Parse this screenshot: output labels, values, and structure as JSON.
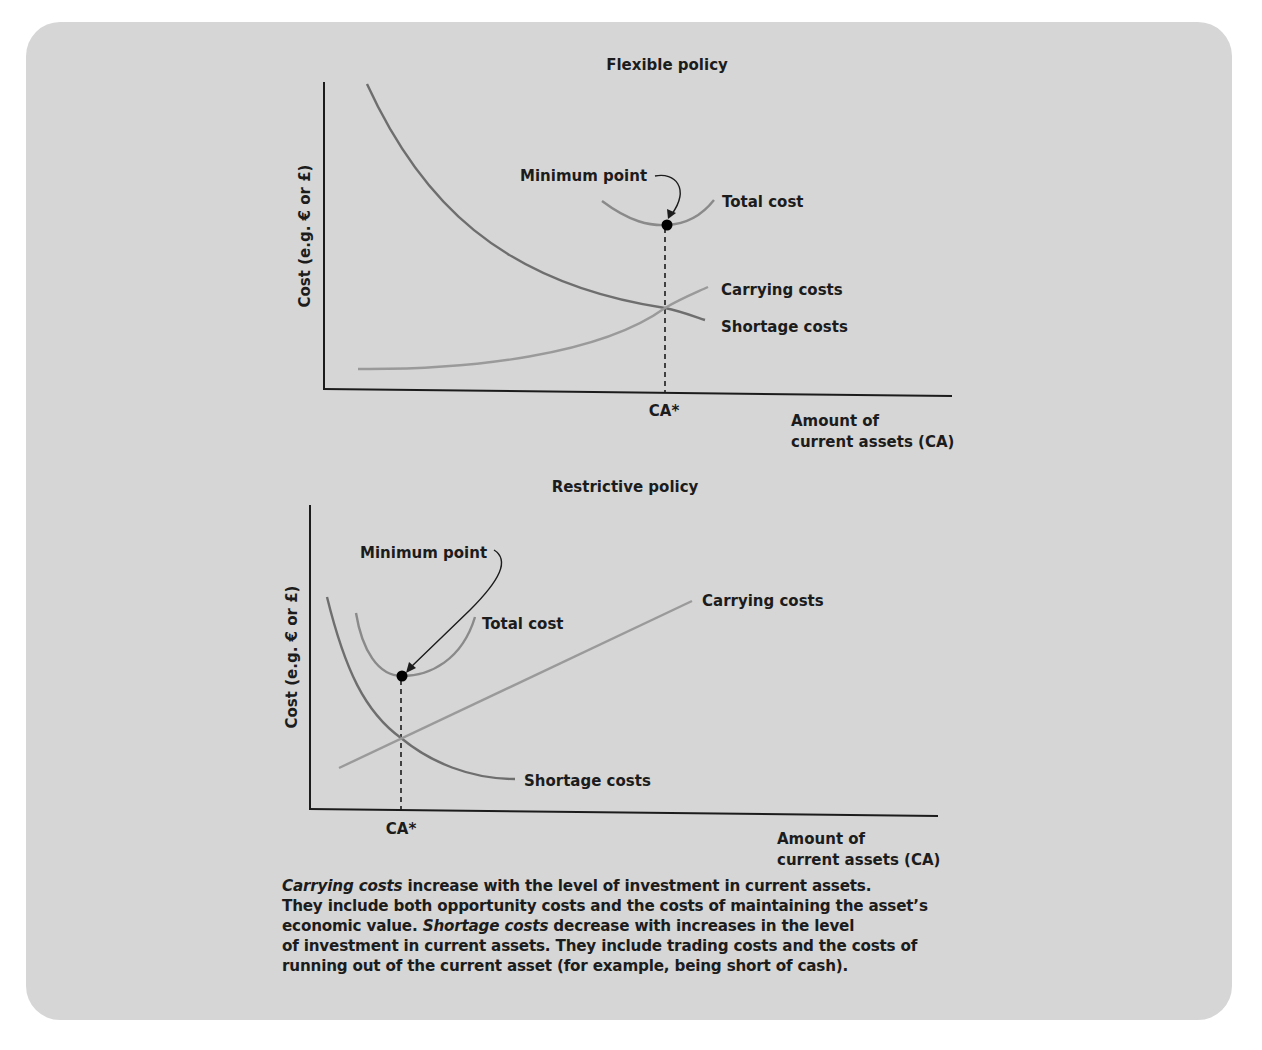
{
  "colors": {
    "panel_background": "#d6d6d6",
    "axis": "#1c1c1c",
    "shortage_curve": "#6e6e6e",
    "carrying_curve": "#9a9a9a",
    "total_curve": "#8a8a8a",
    "minimum_dot": "#000000"
  },
  "chart_data": [
    {
      "type": "line",
      "title": "Flexible policy",
      "xlabel": [
        "Amount of",
        "current assets (CA)"
      ],
      "ylabel": "Cost (e.g. € or £)",
      "x_tick_label": "CA*",
      "grid": false,
      "xlim": [
        0,
        10
      ],
      "ylim": [
        0,
        10
      ],
      "optimum": {
        "x": 5.4,
        "y": 5.1,
        "label": "Minimum point"
      },
      "intersection": {
        "x": 5.4,
        "y": 2.6
      },
      "series": [
        {
          "name": "Shortage costs",
          "label": "Shortage costs",
          "x": [
            0.7,
            1.5,
            2.5,
            3.5,
            4.5,
            5.4,
            6.1
          ],
          "y": [
            9.5,
            7.2,
            5.3,
            4.0,
            3.1,
            2.6,
            2.1
          ]
        },
        {
          "name": "Carrying costs",
          "label": "Carrying costs",
          "x": [
            0.5,
            1.5,
            2.5,
            3.5,
            4.5,
            5.4,
            6.1
          ],
          "y": [
            0.7,
            0.75,
            0.95,
            1.3,
            1.9,
            2.6,
            3.3
          ]
        },
        {
          "name": "Total cost",
          "label": "Total cost",
          "x": [
            4.5,
            5.0,
            5.4,
            5.8,
            6.2
          ],
          "y": [
            5.9,
            5.3,
            5.1,
            5.3,
            5.9
          ]
        }
      ]
    },
    {
      "type": "line",
      "title": "Restrictive policy",
      "xlabel": [
        "Amount of",
        "current assets (CA)"
      ],
      "ylabel": "Cost (e.g. € or £)",
      "x_tick_label": "CA*",
      "grid": false,
      "xlim": [
        0,
        10
      ],
      "ylim": [
        0,
        10
      ],
      "optimum": {
        "x": 1.45,
        "y": 4.5,
        "label": "Minimum point"
      },
      "intersection": {
        "x": 1.45,
        "y": 2.4
      },
      "series": [
        {
          "name": "Shortage costs",
          "label": "Shortage costs",
          "x": [
            0.25,
            0.7,
            1.1,
            1.45,
            2.0,
            2.8,
            3.3
          ],
          "y": [
            7.2,
            5.0,
            3.4,
            2.4,
            1.6,
            1.0,
            1.0
          ]
        },
        {
          "name": "Carrying costs",
          "label": "Carrying costs",
          "x": [
            0.5,
            6.1
          ],
          "y": [
            1.4,
            7.2
          ]
        },
        {
          "name": "Total cost",
          "label": "Total cost",
          "x": [
            0.75,
            1.0,
            1.45,
            2.0,
            2.6
          ],
          "y": [
            6.6,
            5.3,
            4.5,
            5.0,
            6.6
          ]
        }
      ]
    }
  ],
  "caption": {
    "lines": [
      [
        {
          "t": "Carrying costs",
          "i": true
        },
        {
          "t": " increase with the level of investment in current assets.",
          "i": false
        }
      ],
      [
        {
          "t": "They include both opportunity costs and the costs of maintaining the asset’s",
          "i": false
        }
      ],
      [
        {
          "t": "economic value. ",
          "i": false
        },
        {
          "t": "Shortage costs",
          "i": true
        },
        {
          "t": " decrease with increases in the level",
          "i": false
        }
      ],
      [
        {
          "t": "of investment in current assets. They include trading costs and the costs of",
          "i": false
        }
      ],
      [
        {
          "t": "running out of the current asset (for example, being short of cash).",
          "i": false
        }
      ]
    ]
  }
}
